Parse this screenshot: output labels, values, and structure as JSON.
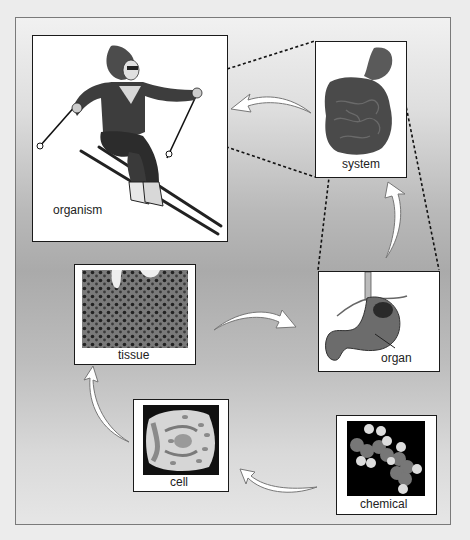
{
  "diagram": {
    "type": "levels-of-organization",
    "colors": {
      "background": "#ececec",
      "frame_gradient_light": "#f1f1f1",
      "frame_gradient_mid": "#aaaaaa",
      "panel_border": "#1a1a1a",
      "arrow_fill": "#ffffff"
    },
    "panels": [
      {
        "id": "chemical",
        "label": "chemical",
        "image": "molecule-icon"
      },
      {
        "id": "cell",
        "label": "cell",
        "image": "cell-icon"
      },
      {
        "id": "tissue",
        "label": "tissue",
        "image": "tissue-micrograph-icon"
      },
      {
        "id": "organ",
        "label": "organ",
        "image": "stomach-icon"
      },
      {
        "id": "system",
        "label": "system",
        "image": "digestive-system-icon"
      },
      {
        "id": "organism",
        "label": "organism",
        "image": "skier-icon"
      }
    ],
    "flow": [
      "chemical",
      "cell",
      "tissue",
      "organ",
      "system",
      "organism"
    ]
  }
}
